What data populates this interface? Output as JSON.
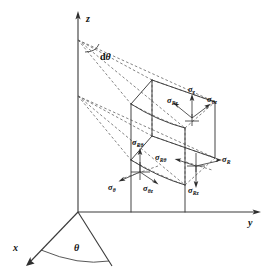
{
  "figure": {
    "background_color": "#ffffff",
    "line_color": "#3a3a3a",
    "text_color": "#101010"
  },
  "axes": [
    {
      "name": "z-axis",
      "label": "z",
      "direction": "up"
    },
    {
      "name": "y-axis",
      "label": "y",
      "direction": "right"
    },
    {
      "name": "x-axis",
      "label": "x",
      "direction": "down-left"
    }
  ],
  "angles": [
    {
      "name": "wedge-angle",
      "label_prefix": "d",
      "label_symbol": "θ",
      "location": "apex on z-axis"
    },
    {
      "name": "azimuth-angle",
      "label_prefix": "",
      "label_symbol": "θ",
      "location": "between x-axis and radial line in base plane"
    }
  ],
  "stress_clusters": [
    {
      "name": "top-face-cluster",
      "location": "top surface of element",
      "labels": [
        {
          "name": "sigma-z",
          "symbol": "σ",
          "subscript": "z",
          "arrow_direction": "up"
        },
        {
          "name": "sigma-Rz",
          "symbol": "σ",
          "subscript": "Rz",
          "arrow_direction": "up-left"
        },
        {
          "name": "sigma-theta-z",
          "symbol": "σ",
          "subscript": "θz",
          "arrow_direction": "up-right"
        }
      ]
    },
    {
      "name": "outer-face-cluster",
      "location": "outer curved face of element",
      "labels": [
        {
          "name": "sigma-R-theta",
          "symbol": "σ",
          "subscript": "Rθ",
          "arrow_direction": "left"
        },
        {
          "name": "sigma-Rz-outer",
          "symbol": "σ",
          "subscript": "Rz",
          "arrow_direction": "down"
        },
        {
          "name": "sigma-R",
          "symbol": "σ",
          "subscript": "R",
          "arrow_direction": "right"
        }
      ]
    },
    {
      "name": "side-face-cluster",
      "location": "radial side face of element",
      "labels": [
        {
          "name": "sigma-R-theta-side",
          "symbol": "σ",
          "subscript": "Rθ",
          "arrow_direction": "up"
        },
        {
          "name": "sigma-theta",
          "symbol": "σ",
          "subscript": "θ",
          "arrow_direction": "down-left"
        },
        {
          "name": "sigma-theta-z-side",
          "symbol": "σ",
          "subscript": "θz",
          "arrow_direction": "down-right"
        }
      ]
    }
  ]
}
